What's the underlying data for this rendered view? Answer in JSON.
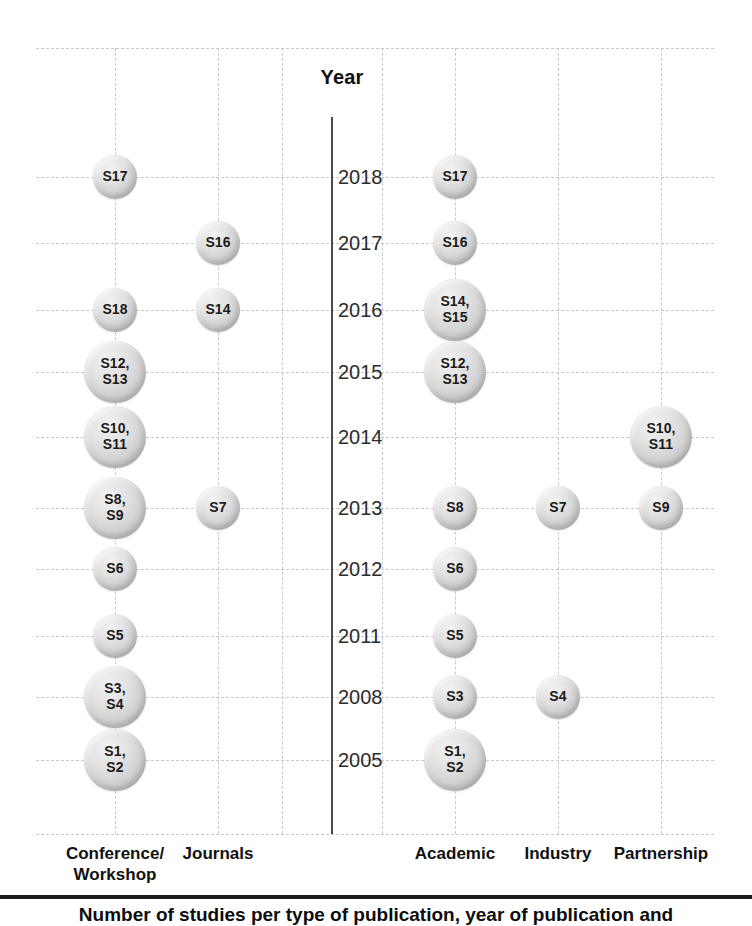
{
  "figure": {
    "axis_title": "Year",
    "caption": "Number of studies per type of publication, year of publication and",
    "colors": {
      "bubble_fill": "#d9d9d9",
      "bubble_edge": "#b4b4b4",
      "grid": "#c9c9c9",
      "axis_spine": "#4a4a4a",
      "text": "#1a1a1a"
    }
  },
  "chart_data": {
    "type": "bubble",
    "title": "",
    "xlabel": "",
    "ylabel": "Year",
    "grid": true,
    "legend": "none",
    "years": [
      2018,
      2017,
      2016,
      2015,
      2014,
      2013,
      2012,
      2011,
      2008,
      2005
    ],
    "panels": [
      {
        "name": "publication-type",
        "side": "left",
        "categories": [
          "Conference/\nWorkshop",
          "Journals"
        ]
      },
      {
        "name": "study-setting",
        "side": "right",
        "categories": [
          "Academic",
          "Industry",
          "Partnership"
        ]
      }
    ],
    "points": [
      {
        "panel": "publication-type",
        "category": "Conference/\nWorkshop",
        "year": 2018,
        "label": "S17",
        "count": 1,
        "x": 115,
        "y": 177,
        "d": 44
      },
      {
        "panel": "publication-type",
        "category": "Conference/\nWorkshop",
        "year": 2016,
        "label": "S18",
        "count": 1,
        "x": 115,
        "y": 310,
        "d": 44
      },
      {
        "panel": "publication-type",
        "category": "Conference/\nWorkshop",
        "year": 2015,
        "label": "S12,\nS13",
        "count": 2,
        "x": 115,
        "y": 372,
        "d": 62
      },
      {
        "panel": "publication-type",
        "category": "Conference/\nWorkshop",
        "year": 2014,
        "label": "S10,\nS11",
        "count": 2,
        "x": 115,
        "y": 437,
        "d": 62
      },
      {
        "panel": "publication-type",
        "category": "Conference/\nWorkshop",
        "year": 2013,
        "label": "S8,\nS9",
        "count": 2,
        "x": 115,
        "y": 508,
        "d": 62
      },
      {
        "panel": "publication-type",
        "category": "Conference/\nWorkshop",
        "year": 2012,
        "label": "S6",
        "count": 1,
        "x": 115,
        "y": 569,
        "d": 44
      },
      {
        "panel": "publication-type",
        "category": "Conference/\nWorkshop",
        "year": 2011,
        "label": "S5",
        "count": 1,
        "x": 115,
        "y": 636,
        "d": 44
      },
      {
        "panel": "publication-type",
        "category": "Conference/\nWorkshop",
        "year": 2008,
        "label": "S3,\nS4",
        "count": 2,
        "x": 115,
        "y": 697,
        "d": 62
      },
      {
        "panel": "publication-type",
        "category": "Conference/\nWorkshop",
        "year": 2005,
        "label": "S1,\nS2",
        "count": 2,
        "x": 115,
        "y": 760,
        "d": 62
      },
      {
        "panel": "publication-type",
        "category": "Journals",
        "year": 2017,
        "label": "S16",
        "count": 1,
        "x": 218,
        "y": 243,
        "d": 44
      },
      {
        "panel": "publication-type",
        "category": "Journals",
        "year": 2016,
        "label": "S14",
        "count": 1,
        "x": 218,
        "y": 310,
        "d": 44
      },
      {
        "panel": "publication-type",
        "category": "Journals",
        "year": 2013,
        "label": "S7",
        "count": 1,
        "x": 218,
        "y": 508,
        "d": 44
      },
      {
        "panel": "study-setting",
        "category": "Academic",
        "year": 2018,
        "label": "S17",
        "count": 1,
        "x": 455,
        "y": 177,
        "d": 44
      },
      {
        "panel": "study-setting",
        "category": "Academic",
        "year": 2017,
        "label": "S16",
        "count": 1,
        "x": 455,
        "y": 243,
        "d": 44
      },
      {
        "panel": "study-setting",
        "category": "Academic",
        "year": 2016,
        "label": "S14,\nS15",
        "count": 2,
        "x": 455,
        "y": 310,
        "d": 62
      },
      {
        "panel": "study-setting",
        "category": "Academic",
        "year": 2015,
        "label": "S12,\nS13",
        "count": 2,
        "x": 455,
        "y": 372,
        "d": 62
      },
      {
        "panel": "study-setting",
        "category": "Academic",
        "year": 2013,
        "label": "S8",
        "count": 1,
        "x": 455,
        "y": 508,
        "d": 44
      },
      {
        "panel": "study-setting",
        "category": "Academic",
        "year": 2012,
        "label": "S6",
        "count": 1,
        "x": 455,
        "y": 569,
        "d": 44
      },
      {
        "panel": "study-setting",
        "category": "Academic",
        "year": 2011,
        "label": "S5",
        "count": 1,
        "x": 455,
        "y": 636,
        "d": 44
      },
      {
        "panel": "study-setting",
        "category": "Academic",
        "year": 2008,
        "label": "S3",
        "count": 1,
        "x": 455,
        "y": 697,
        "d": 44
      },
      {
        "panel": "study-setting",
        "category": "Academic",
        "year": 2005,
        "label": "S1,\nS2",
        "count": 2,
        "x": 455,
        "y": 760,
        "d": 62
      },
      {
        "panel": "study-setting",
        "category": "Industry",
        "year": 2013,
        "label": "S7",
        "count": 1,
        "x": 558,
        "y": 508,
        "d": 44
      },
      {
        "panel": "study-setting",
        "category": "Industry",
        "year": 2008,
        "label": "S4",
        "count": 1,
        "x": 558,
        "y": 697,
        "d": 44
      },
      {
        "panel": "study-setting",
        "category": "Partnership",
        "year": 2014,
        "label": "S10,\nS11",
        "count": 2,
        "x": 661,
        "y": 437,
        "d": 62
      },
      {
        "panel": "study-setting",
        "category": "Partnership",
        "year": 2013,
        "label": "S9",
        "count": 1,
        "x": 661,
        "y": 508,
        "d": 44
      }
    ],
    "vertical_gridlines_x": [
      115,
      218,
      282,
      382,
      455,
      558,
      661
    ],
    "horizontal_gridlines_y": [
      48,
      177,
      243,
      310,
      372,
      437,
      508,
      569,
      636,
      697,
      760,
      834
    ],
    "column_label_positions": [
      {
        "label": "Conference/\nWorkshop",
        "x": 115,
        "y": 843
      },
      {
        "label": "Journals",
        "x": 218,
        "y": 843
      },
      {
        "label": "Academic",
        "x": 455,
        "y": 843
      },
      {
        "label": "Industry",
        "x": 558,
        "y": 843
      },
      {
        "label": "Partnership",
        "x": 661,
        "y": 843
      }
    ],
    "year_tick_y": {
      "2018": 177,
      "2017": 243,
      "2016": 310,
      "2015": 372,
      "2014": 437,
      "2013": 508,
      "2012": 569,
      "2011": 636,
      "2008": 697,
      "2005": 760
    }
  }
}
